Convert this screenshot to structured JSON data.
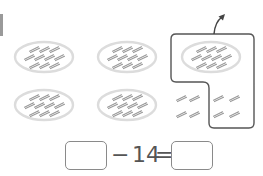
{
  "figure": {
    "bundle_size": 10,
    "bundles": [
      {
        "id": "b1",
        "row": 1,
        "col": 1,
        "sticks": 10,
        "circled": false
      },
      {
        "id": "b2",
        "row": 1,
        "col": 2,
        "sticks": 10,
        "circled": false
      },
      {
        "id": "b3",
        "row": 1,
        "col": 3,
        "sticks": 10,
        "circled": true
      },
      {
        "id": "b4",
        "row": 2,
        "col": 1,
        "sticks": 10,
        "circled": false
      },
      {
        "id": "b5",
        "row": 2,
        "col": 2,
        "sticks": 10,
        "circled": false
      }
    ],
    "loose_sticks": {
      "outside_circle": 4,
      "inside_circle": 4
    },
    "circled_total": 14,
    "arrow": "curved-up-arrow-take-away",
    "colors": {
      "stick": "#9a9a9a",
      "bundle_ring": "#dcdcdc",
      "lasso": "#555555",
      "box_border": "#8a8a8a",
      "text": "#555555"
    }
  },
  "equation": {
    "left_blank": "",
    "operator_minus": "−",
    "subtrahend": "14",
    "operator_equals": "=",
    "right_blank": ""
  }
}
